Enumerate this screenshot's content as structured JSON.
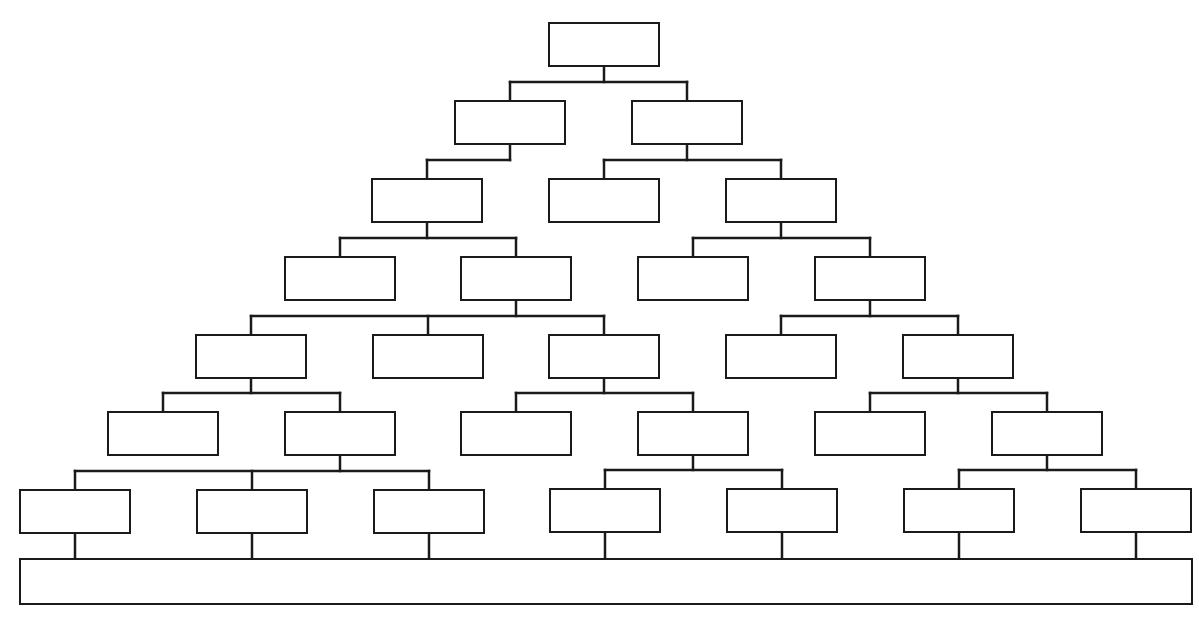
{
  "diagram": {
    "type": "tree-chart-template",
    "line_color": "#1a1a1a",
    "line_width": 2.5,
    "node_size": {
      "w": 112,
      "h": 45
    },
    "levels": 7,
    "nodes": [
      {
        "id": "L1-1",
        "level": 1,
        "x": 548,
        "y": 22,
        "label": ""
      },
      {
        "id": "L2-1",
        "level": 2,
        "x": 454,
        "y": 100,
        "label": "",
        "parent": "L1-1"
      },
      {
        "id": "L2-2",
        "level": 2,
        "x": 631,
        "y": 100,
        "label": "",
        "parent": "L1-1"
      },
      {
        "id": "L3-1",
        "level": 3,
        "x": 371,
        "y": 178,
        "label": "",
        "parent": "L2-1"
      },
      {
        "id": "L3-2",
        "level": 3,
        "x": 548,
        "y": 178,
        "label": "",
        "parent": "L2-2"
      },
      {
        "id": "L3-3",
        "level": 3,
        "x": 725,
        "y": 178,
        "label": "",
        "parent": "L2-2"
      },
      {
        "id": "L4-1",
        "level": 4,
        "x": 284,
        "y": 256,
        "label": "",
        "parent": "L3-1"
      },
      {
        "id": "L4-2",
        "level": 4,
        "x": 460,
        "y": 256,
        "label": "",
        "parent": "L3-1"
      },
      {
        "id": "L4-3",
        "level": 4,
        "x": 637,
        "y": 256,
        "label": "",
        "parent": "L3-3"
      },
      {
        "id": "L4-4",
        "level": 4,
        "x": 814,
        "y": 256,
        "label": "",
        "parent": "L3-3"
      },
      {
        "id": "L5-1",
        "level": 5,
        "x": 195,
        "y": 334,
        "label": "",
        "parent": "L4-2"
      },
      {
        "id": "L5-2",
        "level": 5,
        "x": 372,
        "y": 334,
        "label": "",
        "parent": "L4-2"
      },
      {
        "id": "L5-3",
        "level": 5,
        "x": 548,
        "y": 334,
        "label": "",
        "parent": "L4-2"
      },
      {
        "id": "L5-4",
        "level": 5,
        "x": 725,
        "y": 334,
        "label": "",
        "parent": "L4-4"
      },
      {
        "id": "L5-5",
        "level": 5,
        "x": 902,
        "y": 334,
        "label": "",
        "parent": "L4-4"
      },
      {
        "id": "L6-1",
        "level": 6,
        "x": 107,
        "y": 411,
        "label": "",
        "parent": "L5-1"
      },
      {
        "id": "L6-2",
        "level": 6,
        "x": 284,
        "y": 411,
        "label": "",
        "parent": "L5-1"
      },
      {
        "id": "L6-3",
        "level": 6,
        "x": 460,
        "y": 411,
        "label": "",
        "parent": "L5-3"
      },
      {
        "id": "L6-4",
        "level": 6,
        "x": 637,
        "y": 411,
        "label": "",
        "parent": "L5-3"
      },
      {
        "id": "L6-5",
        "level": 6,
        "x": 814,
        "y": 411,
        "label": "",
        "parent": "L5-5"
      },
      {
        "id": "L6-6",
        "level": 6,
        "x": 991,
        "y": 411,
        "label": "",
        "parent": "L5-5"
      },
      {
        "id": "L7-1",
        "level": 7,
        "x": 19,
        "y": 489,
        "label": "",
        "parent": "L6-2"
      },
      {
        "id": "L7-2",
        "level": 7,
        "x": 196,
        "y": 489,
        "label": "",
        "parent": "L6-2"
      },
      {
        "id": "L7-3",
        "level": 7,
        "x": 373,
        "y": 489,
        "label": "",
        "parent": "L6-2"
      },
      {
        "id": "L7-4",
        "level": 7,
        "x": 549,
        "y": 488,
        "label": "",
        "parent": "L6-4"
      },
      {
        "id": "L7-5",
        "level": 7,
        "x": 726,
        "y": 488,
        "label": "",
        "parent": "L6-4"
      },
      {
        "id": "L7-6",
        "level": 7,
        "x": 903,
        "y": 488,
        "label": "",
        "parent": "L6-6"
      },
      {
        "id": "L7-7",
        "level": 7,
        "x": 1080,
        "y": 488,
        "label": "",
        "parent": "L6-6"
      }
    ],
    "base_bar": {
      "x": 19,
      "y": 558,
      "w": 1174,
      "h": 47,
      "label": "",
      "children": [
        "L7-1",
        "L7-2",
        "L7-3",
        "L7-4",
        "L7-5",
        "L7-6",
        "L7-7"
      ]
    }
  }
}
